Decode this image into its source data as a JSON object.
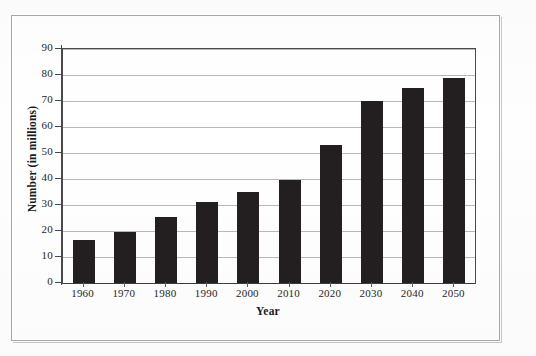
{
  "chart_data": {
    "type": "bar",
    "title": "",
    "xlabel": "Year",
    "ylabel": "Number (in millions)",
    "categories": [
      "1960",
      "1970",
      "1980",
      "1990",
      "2000",
      "2010",
      "2020",
      "2030",
      "2040",
      "2050"
    ],
    "values": [
      16.5,
      19.5,
      25.5,
      31,
      35,
      39.5,
      53,
      70,
      75,
      79
    ],
    "ylim": [
      0,
      90
    ],
    "ytick_step": 10,
    "yticks": [
      "0",
      "10",
      "20",
      "30",
      "40",
      "50",
      "60",
      "70",
      "80",
      "90"
    ],
    "grid": "horizontal",
    "legend": "none",
    "bar_color": "#231f20",
    "gridline_color": "#b9b9bb",
    "axis_color": "#4a4a4a",
    "background_color": "#ffffff"
  },
  "figure": {
    "border_color": "#a9a9ab",
    "page_background": "#fefefe"
  }
}
